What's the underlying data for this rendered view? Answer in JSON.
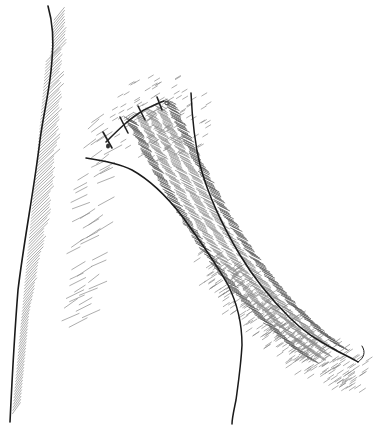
{
  "figure": {
    "type": "pen-and-ink medical illustration",
    "alt": "Line drawing of a tubular skin flap arising from a body surface, attached at its upper end with a row of interrupted sutures",
    "suture_count": 4,
    "colors": {
      "background": "#ffffff",
      "ink": "#1a1a1a",
      "hatching": "#8a8a8a"
    }
  }
}
